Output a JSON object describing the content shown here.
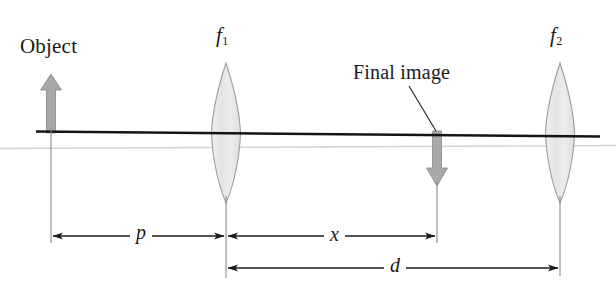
{
  "figure": {
    "labels": {
      "object": "Object",
      "final_image": "Final image",
      "lens1_focal": "f",
      "lens1_focal_sub": "1",
      "lens2_focal": "f",
      "lens2_focal_sub": "2",
      "distance_p": "p",
      "distance_x": "x",
      "distance_d": "d"
    },
    "colors": {
      "axis": "#141414",
      "faint_axis": "#c9c9c9",
      "arrow_fill": "#a8a8a8",
      "arrow_stroke": "#8f8f8f",
      "lens_fill": "#e9e9e9",
      "lens_stroke": "#9a9a9a",
      "dimension_line": "#1a1a1a",
      "extension_line": "#8a8a8a",
      "background": "#ffffff",
      "text": "#1a1a1a"
    },
    "geometry": {
      "axis_y": 133,
      "axis_x_start": 36,
      "axis_x_end": 600,
      "object_x": 51,
      "lens1_x": 226,
      "image_x": 437,
      "lens2_x": 560,
      "dim_row_1_y": 236,
      "dim_row_2_y": 268
    }
  }
}
